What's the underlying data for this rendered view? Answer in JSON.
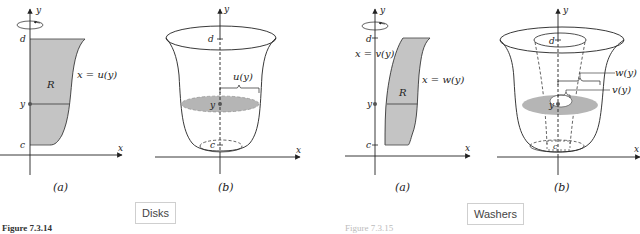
{
  "figures": {
    "disks": {
      "tag": "Disks",
      "caption": "Figure 7.3.14",
      "panel_a": {
        "label": "(a)",
        "axis_x": "x",
        "axis_y": "y",
        "tick_d": "d",
        "tick_c": "c",
        "tick_y": "y",
        "region": "R",
        "curve": "x = u(y)"
      },
      "panel_b": {
        "label": "(b)",
        "axis_x": "x",
        "axis_y": "y",
        "tick_d": "d",
        "tick_c": "c",
        "tick_y": "y",
        "radius": "u(y)"
      }
    },
    "washers": {
      "tag": "Washers",
      "caption": "Figure 7.3.15",
      "panel_a": {
        "label": "(a)",
        "axis_x": "x",
        "axis_y": "y",
        "tick_d": "d",
        "tick_c": "c",
        "tick_y": "y",
        "region": "R",
        "curve_inner": "x = v(y)",
        "curve_outer": "x = w(y)"
      },
      "panel_b": {
        "label": "(b)",
        "axis_x": "x",
        "axis_y": "y",
        "tick_d": "d",
        "tick_c": "c",
        "tick_y": "y",
        "radius_outer": "w(y)",
        "radius_inner": "v(y)"
      }
    }
  },
  "colors": {
    "region_fill": "#c4c4c4",
    "disk_fill": "#b5b5b5",
    "stroke": "#222222"
  }
}
